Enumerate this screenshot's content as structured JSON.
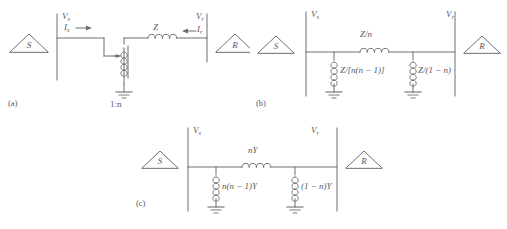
{
  "figure": {
    "caption_labels": [
      "(a)",
      "(b)",
      "(c)"
    ],
    "line_color": "#6d6e71",
    "text_color": "#58595b",
    "background": "#ffffff"
  },
  "panel_a": {
    "tag": "(a)",
    "source_node": "S",
    "receiving_node": "R",
    "sending_voltage": "V",
    "sending_voltage_sub": "s",
    "sending_current": "I",
    "sending_current_sub": "s",
    "receiving_voltage": "V",
    "receiving_voltage_sub": "r",
    "receiving_current": "I",
    "receiving_current_sub": "r",
    "series_impedance": "Z",
    "transformer_ratio": "1:n",
    "arrow_left": "→",
    "arrow_right": "←"
  },
  "panel_b": {
    "tag": "(b)",
    "source_node": "S",
    "receiving_node": "R",
    "sending_voltage": "V",
    "sending_voltage_sub": "s",
    "receiving_voltage": "V",
    "receiving_voltage_sub": "r",
    "series_impedance": "Z/n",
    "shunt_left": "Z/[n(n − 1)]",
    "shunt_right": "Z/(1 − n)"
  },
  "panel_c": {
    "tag": "(c)",
    "source_node": "S",
    "receiving_node": "R",
    "sending_voltage": "V",
    "sending_voltage_sub": "s",
    "receiving_voltage": "V",
    "receiving_voltage_sub": "r",
    "series_admittance": "nY",
    "shunt_left": "n(n − 1)Y",
    "shunt_right": "(1 − n)Y"
  }
}
